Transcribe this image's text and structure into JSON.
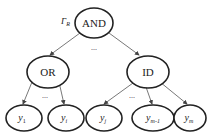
{
  "diagram": {
    "root": {
      "label": "AND",
      "annotation": "Γ",
      "annotation_sub": "R"
    },
    "middle": [
      {
        "id": "or",
        "label": "OR"
      },
      {
        "id": "id",
        "label": "ID"
      }
    ],
    "leaves": [
      {
        "base": "y",
        "sub": "1",
        "parent": "or"
      },
      {
        "base": "y",
        "sub": "i",
        "parent": "or"
      },
      {
        "base": "y",
        "sub": "j",
        "parent": "id"
      },
      {
        "base": "y",
        "sub": "m-1",
        "parent": "id"
      },
      {
        "base": "y",
        "sub": "m",
        "parent": "id"
      }
    ],
    "ellipsis": "..."
  }
}
